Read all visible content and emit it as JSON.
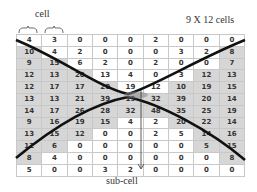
{
  "labels": {
    "cell": "cell",
    "grid_size": "9 X 12 cells",
    "sub_cell": "sub-cell"
  },
  "grid": {
    "columns": 9,
    "rows": 12,
    "values": [
      [
        4,
        3,
        0,
        0,
        0,
        2,
        0,
        0,
        0
      ],
      [
        10,
        4,
        2,
        0,
        0,
        0,
        3,
        2,
        8
      ],
      [
        9,
        15,
        6,
        2,
        0,
        2,
        0,
        0,
        7
      ],
      [
        12,
        13,
        20,
        13,
        4,
        0,
        3,
        12,
        13
      ],
      [
        12,
        17,
        17,
        20,
        19,
        12,
        10,
        19,
        15
      ],
      [
        13,
        13,
        21,
        39,
        19,
        32,
        39,
        20,
        14
      ],
      [
        14,
        17,
        26,
        28,
        32,
        48,
        35,
        25,
        19
      ],
      [
        9,
        16,
        19,
        15,
        4,
        2,
        20,
        22,
        14
      ],
      [
        13,
        15,
        12,
        0,
        0,
        2,
        5,
        14,
        16
      ],
      [
        12,
        6,
        0,
        0,
        0,
        0,
        0,
        5,
        15
      ],
      [
        8,
        4,
        0,
        0,
        0,
        0,
        0,
        0,
        8
      ],
      [
        5,
        0,
        0,
        3,
        2,
        0,
        0,
        0,
        0
      ]
    ],
    "shaded": [
      [
        0,
        0,
        0,
        0,
        0,
        0,
        0,
        0,
        0
      ],
      [
        1,
        0,
        0,
        0,
        0,
        0,
        0,
        0,
        1
      ],
      [
        1,
        1,
        0,
        0,
        0,
        0,
        0,
        0,
        1
      ],
      [
        1,
        1,
        1,
        0,
        0,
        0,
        0,
        1,
        1
      ],
      [
        1,
        1,
        1,
        1,
        0,
        0,
        1,
        1,
        1
      ],
      [
        1,
        1,
        1,
        1,
        1,
        1,
        1,
        1,
        1
      ],
      [
        1,
        1,
        1,
        1,
        1,
        1,
        1,
        1,
        1
      ],
      [
        1,
        1,
        1,
        1,
        0,
        0,
        1,
        1,
        1
      ],
      [
        1,
        1,
        1,
        0,
        0,
        0,
        0,
        1,
        1
      ],
      [
        1,
        1,
        0,
        0,
        0,
        0,
        0,
        1,
        1
      ],
      [
        1,
        0,
        0,
        0,
        0,
        0,
        0,
        0,
        1
      ],
      [
        0,
        0,
        0,
        0,
        0,
        0,
        0,
        0,
        0
      ]
    ]
  },
  "colors": {
    "shade": "#d6d6d6",
    "grid_line": "#c8c8c8",
    "curve": "#111111"
  }
}
